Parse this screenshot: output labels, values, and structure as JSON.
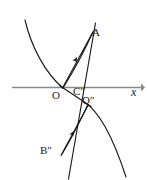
{
  "figure": {
    "background_color": "#ffffff",
    "stroke_color": "#1a1a1a",
    "axis_color": "#888888",
    "width": 147,
    "height": 180
  },
  "axes": {
    "x_axis": {
      "name": "x-axis",
      "label": "x",
      "color": "#888888",
      "y_position": 87,
      "x_start": 12,
      "x_end": 142,
      "arrow": "right"
    }
  },
  "labels": [
    {
      "id": "A",
      "text": "A",
      "x": 92,
      "y": 27,
      "italic": false
    },
    {
      "id": "O",
      "text": "O",
      "x": 52,
      "y": 90,
      "italic": false
    },
    {
      "id": "Cpp",
      "text": "C″",
      "x": 73,
      "y": 86,
      "italic": false
    },
    {
      "id": "Opp",
      "text": "O″",
      "x": 82,
      "y": 95,
      "italic": false
    },
    {
      "id": "Bpp",
      "text": "B″",
      "x": 40,
      "y": 145,
      "italic": false
    },
    {
      "id": "x",
      "text": "x",
      "x": 131,
      "y": 86,
      "italic": true
    }
  ],
  "curves": [
    {
      "id": "upper-parabola-arc",
      "name": "upper-parabola-arc",
      "description": "Concave-up arc descending from upper-left to the origin region",
      "path": "M 25 20 C 32 48, 46 74, 63 88"
    },
    {
      "id": "lower-parabola-arc",
      "name": "lower-parabola-arc",
      "description": "Concave-down arc from near O-double-prime curving down to lower right",
      "path": "M 85 103 C 100 112, 114 138, 126 176"
    },
    {
      "id": "upper-chord-arc",
      "name": "upper-chord-arc",
      "description": "Curved chord from origin up to A with arrowhead",
      "path": "M 64 88 C 72 74, 84 52, 92 34"
    },
    {
      "id": "lower-chord-arc",
      "name": "lower-chord-arc",
      "description": "Curved chord from B-double-prime up to O-double-prime with arrowhead",
      "path": "M 62 153 C 70 140, 80 120, 87 106"
    }
  ],
  "lines": [
    {
      "id": "line-A-to-Bpp",
      "name": "line-A-to-B-double-prime",
      "description": "Long straight line from A through origin region down to B-double-prime and beyond",
      "x1": 95,
      "y1": 24,
      "x2": 68,
      "y2": 178
    },
    {
      "id": "line-O-to-A",
      "name": "line-O-to-A",
      "description": "Straight chord from origin up to A",
      "x1": 63,
      "y1": 88,
      "x2": 93,
      "y2": 32
    },
    {
      "id": "line-Bpp-to-Opp",
      "name": "line-B-double-prime-to-O-double-prime",
      "description": "Straight chord from B-double-prime up to O-double-prime",
      "x1": 61,
      "y1": 155,
      "x2": 88,
      "y2": 105
    },
    {
      "id": "line-O-to-Opp",
      "name": "line-O-to-O-double-prime",
      "description": "Straight secant from origin through C-double-prime to O-double-prime",
      "x1": 60,
      "y1": 86,
      "x2": 91,
      "y2": 106
    }
  ],
  "arrowheads": [
    {
      "id": "arrow-upper-chord",
      "name": "upper-chord-arrowhead",
      "x": 76,
      "y": 58,
      "angle": -62
    },
    {
      "id": "arrow-lower-chord",
      "name": "lower-chord-arrowhead",
      "x": 73,
      "y": 133,
      "angle": -58
    },
    {
      "id": "arrow-x-axis",
      "name": "x-axis-arrowhead",
      "x": 142,
      "y": 87,
      "angle": 0
    }
  ],
  "points": [
    {
      "id": "point-O",
      "name": "origin-point",
      "x": 63,
      "y": 88
    },
    {
      "id": "point-Cpp",
      "name": "c-double-prime-point",
      "x": 77,
      "y": 96
    },
    {
      "id": "point-Opp",
      "name": "o-double-prime-point",
      "x": 88,
      "y": 104
    },
    {
      "id": "point-A",
      "name": "a-point",
      "x": 93,
      "y": 32
    },
    {
      "id": "point-Bpp",
      "name": "b-double-prime-point",
      "x": 62,
      "y": 153
    }
  ]
}
